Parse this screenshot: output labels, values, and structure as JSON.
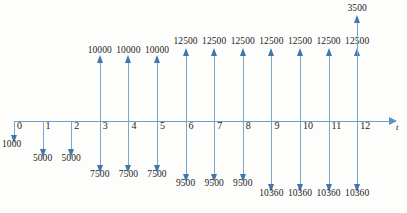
{
  "figure": {
    "type": "cash-flow-diagram",
    "axis_label": "t",
    "axis": {
      "origin_x": 14,
      "spacing": 28.6,
      "y": 121,
      "ticks": [
        0,
        1,
        2,
        3,
        4,
        5,
        6,
        7,
        8,
        9,
        10,
        11,
        12
      ],
      "tick_labels": [
        "0",
        "1",
        "2",
        "3",
        "4",
        "5",
        "6",
        "7",
        "8",
        "9",
        "10",
        "11",
        "12"
      ]
    },
    "colors": {
      "axis": "#6e9fc8",
      "arrow": "#7aa6cb",
      "arrowhead": "#3f77ab",
      "text": "#1c1c1c",
      "background": "#fdfdfc"
    }
  },
  "chart_data": {
    "type": "bar",
    "title": "",
    "xlabel": "t",
    "ylabel": "",
    "categories": [
      "0",
      "1",
      "2",
      "3",
      "4",
      "5",
      "6",
      "7",
      "8",
      "9",
      "10",
      "11",
      "12"
    ],
    "series": [
      {
        "name": "Cash inflows (upward arrows)",
        "direction": "up",
        "values": [
          0,
          0,
          0,
          10000,
          10000,
          10000,
          12500,
          12500,
          12500,
          12500,
          12500,
          12500,
          12500
        ]
      },
      {
        "name": "Salvage / extra inflow at t=12 (upward arrow)",
        "direction": "up",
        "values": [
          0,
          0,
          0,
          0,
          0,
          0,
          0,
          0,
          0,
          0,
          0,
          0,
          3500
        ]
      },
      {
        "name": "Cash outflows (downward arrows)",
        "direction": "down",
        "values": [
          1000,
          5000,
          5000,
          7500,
          7500,
          7500,
          9500,
          9500,
          9500,
          10360,
          10360,
          10360,
          10360
        ]
      }
    ]
  },
  "arrows": {
    "up": [
      {
        "t": 3,
        "label": "10000",
        "len": 59,
        "label_y": 45
      },
      {
        "t": 4,
        "label": "10000",
        "len": 59,
        "label_y": 45
      },
      {
        "t": 5,
        "label": "10000",
        "len": 59,
        "label_y": 45
      },
      {
        "t": 6,
        "label": "12500",
        "len": 66,
        "label_y": 36
      },
      {
        "t": 7,
        "label": "12500",
        "len": 66,
        "label_y": 36
      },
      {
        "t": 8,
        "label": "12500",
        "len": 66,
        "label_y": 36
      },
      {
        "t": 9,
        "label": "12500",
        "len": 66,
        "label_y": 36
      },
      {
        "t": 10,
        "label": "12500",
        "len": 66,
        "label_y": 36
      },
      {
        "t": 11,
        "label": "12500",
        "len": 66,
        "label_y": 36
      },
      {
        "t": 12,
        "label": "12500",
        "len": 66,
        "label_y": 36
      },
      {
        "t": 12,
        "label": "3500",
        "len": 99,
        "label_y": 3
      }
    ],
    "down": [
      {
        "t": 0,
        "label": "1000",
        "len": 15,
        "label_y": 139,
        "label_align": "left"
      },
      {
        "t": 1,
        "label": "5000",
        "len": 29,
        "label_y": 153
      },
      {
        "t": 2,
        "label": "5000",
        "len": 29,
        "label_y": 153
      },
      {
        "t": 3,
        "label": "7500",
        "len": 45,
        "label_y": 169
      },
      {
        "t": 4,
        "label": "7500",
        "len": 45,
        "label_y": 169
      },
      {
        "t": 5,
        "label": "7500",
        "len": 45,
        "label_y": 169
      },
      {
        "t": 6,
        "label": "9500",
        "len": 54,
        "label_y": 178
      },
      {
        "t": 7,
        "label": "9500",
        "len": 54,
        "label_y": 178
      },
      {
        "t": 8,
        "label": "9500",
        "len": 54,
        "label_y": 178
      },
      {
        "t": 9,
        "label": "10360",
        "len": 64,
        "label_y": 188
      },
      {
        "t": 10,
        "label": "10360",
        "len": 64,
        "label_y": 188
      },
      {
        "t": 11,
        "label": "10360",
        "len": 64,
        "label_y": 188
      },
      {
        "t": 12,
        "label": "10360",
        "len": 64,
        "label_y": 188
      }
    ]
  }
}
